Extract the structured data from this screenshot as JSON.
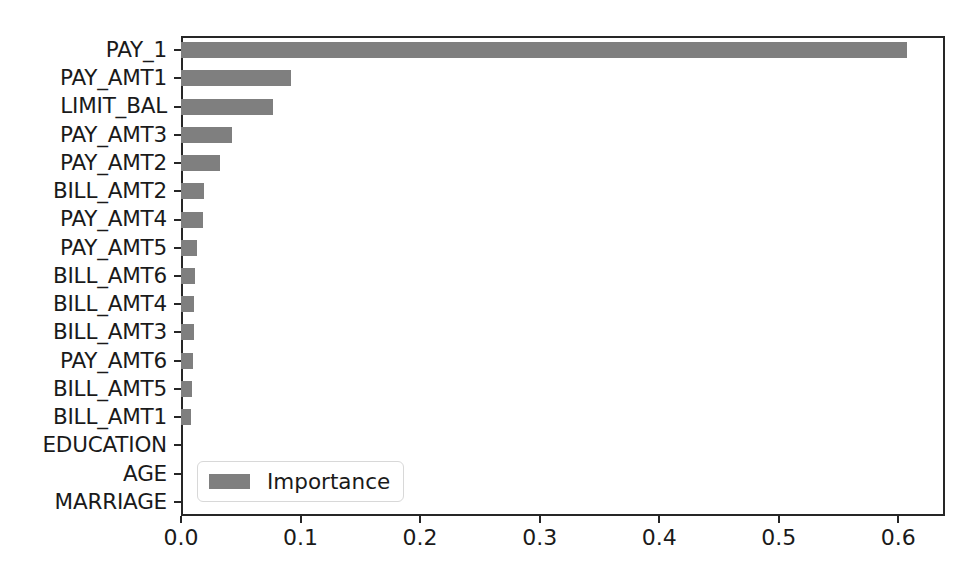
{
  "chart_data": {
    "type": "bar",
    "orientation": "horizontal",
    "title": "",
    "xlabel": "",
    "ylabel": "",
    "categories": [
      "PAY_1",
      "PAY_AMT1",
      "LIMIT_BAL",
      "PAY_AMT3",
      "PAY_AMT2",
      "BILL_AMT2",
      "PAY_AMT4",
      "PAY_AMT5",
      "BILL_AMT6",
      "BILL_AMT4",
      "BILL_AMT3",
      "PAY_AMT6",
      "BILL_AMT5",
      "BILL_AMT1",
      "EDUCATION",
      "AGE",
      "MARRIAGE"
    ],
    "values": [
      0.607,
      0.092,
      0.077,
      0.043,
      0.033,
      0.019,
      0.018,
      0.013,
      0.012,
      0.011,
      0.011,
      0.01,
      0.009,
      0.008,
      0.0,
      0.0,
      0.0
    ],
    "series": [
      {
        "name": "Importance",
        "color": "#7f7f7f",
        "values": [
          0.607,
          0.092,
          0.077,
          0.043,
          0.033,
          0.019,
          0.018,
          0.013,
          0.012,
          0.011,
          0.011,
          0.01,
          0.009,
          0.008,
          0.0,
          0.0,
          0.0
        ]
      }
    ],
    "xticks": [
      0.0,
      0.1,
      0.2,
      0.3,
      0.4,
      0.5,
      0.6
    ],
    "xtick_labels": [
      "0.0",
      "0.1",
      "0.2",
      "0.3",
      "0.4",
      "0.5",
      "0.6"
    ],
    "xlim": [
      0.0,
      0.639
    ],
    "grid": false,
    "legend": {
      "entries": [
        {
          "label": "Importance",
          "color": "#7f7f7f"
        }
      ],
      "position": "lower left"
    },
    "bar_color": "#7f7f7f",
    "frame_color": "#262626"
  }
}
